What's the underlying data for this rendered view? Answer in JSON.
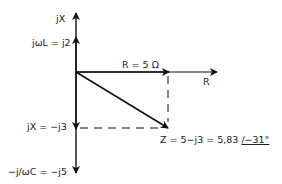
{
  "diagram": {
    "axes": {
      "imaginary_label": "jX",
      "real_label": "R"
    },
    "labels": {
      "inductive": "jωL = j2",
      "resistance": "R = 5 Ω",
      "reactance": "jX = −j3",
      "capacitive": "−j/ωC = −j5",
      "impedance_prefix": "Z = 5−j3 = 5,83 ",
      "impedance_angle": "/−31°"
    },
    "values": {
      "R": 5,
      "XL": 2,
      "XC": -5,
      "X": -3,
      "Z_magnitude": 5.83,
      "Z_angle_deg": -31
    },
    "colors": {
      "line": "#111111",
      "text": "#222222"
    }
  }
}
